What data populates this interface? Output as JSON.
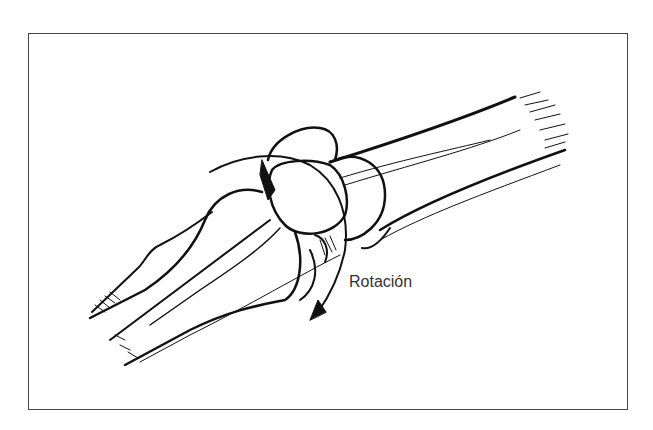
{
  "figure": {
    "annotations": [
      {
        "label": "Rotación",
        "type": "rotation-arrow"
      }
    ],
    "colors": {
      "ink": "#111111",
      "frame": "#444444",
      "label": "#333333",
      "background": "#ffffff"
    }
  }
}
